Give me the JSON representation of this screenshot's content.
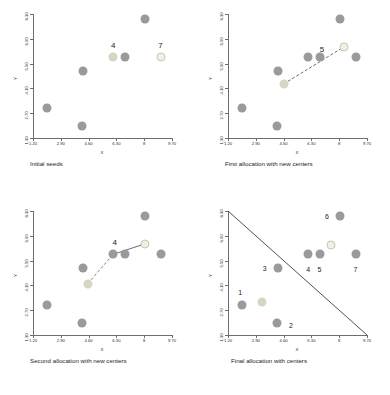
{
  "figure": {
    "axis_titles": {
      "x": "X",
      "y": "Y"
    },
    "x_ticks": [
      "1.20",
      "2.90",
      "4.60",
      "6.30",
      "8",
      "9.70"
    ],
    "y_ticks": [
      "1.30",
      "2.70",
      "4.10",
      "5.50",
      "6.90",
      "8.30"
    ],
    "colors": {
      "data_point": "#9a9a9a",
      "center_filled": "#d9d5c3",
      "center_outlined": "#f2f0e4",
      "axis": "#6e6e6e",
      "separator_line": "#3d3d3d",
      "text": "#1b1b1b"
    }
  },
  "chart_data": [
    {
      "type": "scatter",
      "title": "Initial seeds",
      "xlabel": "X",
      "ylabel": "Y",
      "xlim": [
        1.2,
        9.7
      ],
      "ylim": [
        1.3,
        8.3
      ],
      "grid": false,
      "legend": "none",
      "series": [
        {
          "name": "data points",
          "role": "data",
          "points": [
            {
              "x": 2.05,
              "y": 3.0
            },
            {
              "x": 4.2,
              "y": 1.95
            },
            {
              "x": 4.25,
              "y": 5.1
            },
            {
              "x": 6.8,
              "y": 5.85
            },
            {
              "x": 8.05,
              "y": 8.0
            }
          ]
        },
        {
          "name": "seed centers",
          "role": "center",
          "points": [
            {
              "x": 6.1,
              "y": 5.85,
              "label": "4",
              "style": "filled"
            },
            {
              "x": 9.0,
              "y": 5.85,
              "label": "7",
              "style": "outlined"
            }
          ]
        }
      ],
      "annotations": [
        {
          "text": "4",
          "x": 6.1,
          "y": 6.55
        },
        {
          "text": "7",
          "x": 9.0,
          "y": 6.55
        }
      ]
    },
    {
      "type": "scatter",
      "title": "First allocation with new centers",
      "xlabel": "X",
      "ylabel": "Y",
      "xlim": [
        1.2,
        9.7
      ],
      "ylim": [
        1.3,
        8.3
      ],
      "grid": false,
      "legend": "none",
      "series": [
        {
          "name": "data points",
          "role": "data",
          "points": [
            {
              "x": 2.05,
              "y": 3.0
            },
            {
              "x": 4.2,
              "y": 1.95
            },
            {
              "x": 4.25,
              "y": 5.1
            },
            {
              "x": 6.1,
              "y": 5.85
            },
            {
              "x": 6.8,
              "y": 5.85
            },
            {
              "x": 8.05,
              "y": 8.0
            },
            {
              "x": 9.0,
              "y": 5.85
            }
          ]
        },
        {
          "name": "old center",
          "role": "center",
          "points": [
            {
              "x": 4.6,
              "y": 4.35,
              "style": "filled"
            }
          ]
        },
        {
          "name": "new center",
          "role": "center",
          "points": [
            {
              "x": 8.3,
              "y": 6.45,
              "style": "outlined"
            }
          ]
        }
      ],
      "arrow": {
        "from": {
          "x": 4.6,
          "y": 4.35
        },
        "to": {
          "x": 8.3,
          "y": 6.45
        },
        "style": "dashed"
      },
      "annotations": [
        {
          "text": "5",
          "x": 6.95,
          "y": 6.35
        }
      ]
    },
    {
      "type": "scatter",
      "title": "Second allocation with new centers",
      "xlabel": "X",
      "ylabel": "Y",
      "xlim": [
        1.2,
        9.7
      ],
      "ylim": [
        1.3,
        8.3
      ],
      "grid": false,
      "legend": "none",
      "series": [
        {
          "name": "data points",
          "role": "data",
          "points": [
            {
              "x": 2.05,
              "y": 3.0
            },
            {
              "x": 4.2,
              "y": 1.95
            },
            {
              "x": 4.25,
              "y": 5.1
            },
            {
              "x": 6.1,
              "y": 5.85
            },
            {
              "x": 6.8,
              "y": 5.85
            },
            {
              "x": 8.05,
              "y": 8.0
            },
            {
              "x": 9.0,
              "y": 5.85
            }
          ]
        },
        {
          "name": "old center",
          "role": "center",
          "points": [
            {
              "x": 4.55,
              "y": 4.2,
              "style": "filled"
            }
          ]
        },
        {
          "name": "new center",
          "role": "center",
          "points": [
            {
              "x": 8.05,
              "y": 6.45,
              "style": "outlined"
            }
          ]
        }
      ],
      "arrow": {
        "from": {
          "x": 6.1,
          "y": 5.85
        },
        "to": {
          "x": 8.05,
          "y": 6.45
        },
        "style": "solid"
      },
      "dashed_segment": {
        "from": {
          "x": 4.55,
          "y": 4.2
        },
        "to": {
          "x": 6.1,
          "y": 5.85
        }
      },
      "annotations": [
        {
          "text": "4",
          "x": 6.2,
          "y": 6.55
        }
      ]
    },
    {
      "type": "scatter",
      "title": "Final allocation with centers",
      "xlabel": "X",
      "ylabel": "Y",
      "xlim": [
        1.2,
        9.7
      ],
      "ylim": [
        1.3,
        8.3
      ],
      "grid": false,
      "legend": "none",
      "series": [
        {
          "name": "data points",
          "role": "data",
          "points": [
            {
              "x": 2.05,
              "y": 3.0,
              "label": "1"
            },
            {
              "x": 4.2,
              "y": 1.95,
              "label": "2"
            },
            {
              "x": 4.25,
              "y": 5.1,
              "label": "3"
            },
            {
              "x": 6.1,
              "y": 5.85,
              "label": "4"
            },
            {
              "x": 6.8,
              "y": 5.85,
              "label": "5"
            },
            {
              "x": 8.05,
              "y": 8.0,
              "label": "6"
            },
            {
              "x": 9.0,
              "y": 5.85,
              "label": "7"
            }
          ]
        },
        {
          "name": "cluster centers",
          "role": "center",
          "points": [
            {
              "x": 3.3,
              "y": 3.15,
              "style": "filled"
            },
            {
              "x": 7.5,
              "y": 6.4,
              "style": "outlined"
            }
          ]
        }
      ],
      "separator_line": {
        "from": {
          "x": 1.2,
          "y": 8.3
        },
        "to": {
          "x": 9.7,
          "y": 1.3
        }
      },
      "annotations": [
        {
          "text": "1",
          "x": 1.95,
          "y": 3.7
        },
        {
          "text": "2",
          "x": 5.05,
          "y": 1.85
        },
        {
          "text": "3",
          "x": 3.45,
          "y": 5.1
        },
        {
          "text": "4",
          "x": 6.1,
          "y": 5.05
        },
        {
          "text": "5",
          "x": 6.8,
          "y": 5.05
        },
        {
          "text": "6",
          "x": 7.25,
          "y": 8.0
        },
        {
          "text": "7",
          "x": 9.0,
          "y": 5.05
        }
      ]
    }
  ]
}
